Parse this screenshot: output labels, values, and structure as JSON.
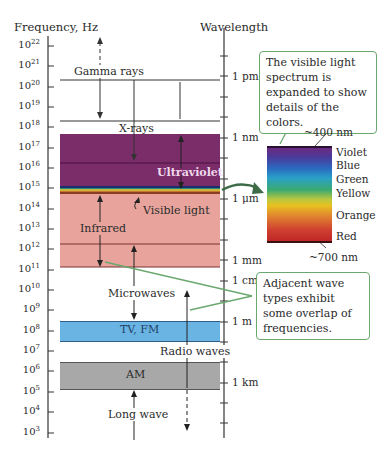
{
  "diagram": {
    "left_axis_title": "Frequency, Hz",
    "right_axis_title": "Wavelength",
    "frequency_ticks": [
      {
        "base": "10",
        "exp": "22"
      },
      {
        "base": "10",
        "exp": "21"
      },
      {
        "base": "10",
        "exp": "20"
      },
      {
        "base": "10",
        "exp": "19"
      },
      {
        "base": "10",
        "exp": "18"
      },
      {
        "base": "10",
        "exp": "17"
      },
      {
        "base": "10",
        "exp": "16"
      },
      {
        "base": "10",
        "exp": "15"
      },
      {
        "base": "10",
        "exp": "14"
      },
      {
        "base": "10",
        "exp": "13"
      },
      {
        "base": "10",
        "exp": "12"
      },
      {
        "base": "10",
        "exp": "11"
      },
      {
        "base": "10",
        "exp": "10"
      },
      {
        "base": "10",
        "exp": "9"
      },
      {
        "base": "10",
        "exp": "8"
      },
      {
        "base": "10",
        "exp": "7"
      },
      {
        "base": "10",
        "exp": "6"
      },
      {
        "base": "10",
        "exp": "5"
      },
      {
        "base": "10",
        "exp": "4"
      },
      {
        "base": "10",
        "exp": "3"
      }
    ],
    "wavelength_labels": {
      "pm": "1 pm",
      "nm": "1 nm",
      "um": "1 μm",
      "mm": "1 mm",
      "cm": "1 cm",
      "m": "1 m",
      "km": "1 km"
    },
    "bands": {
      "gamma": "Gamma rays",
      "xray": "X-rays",
      "uv": "Ultraviolet",
      "visible": "Visible light",
      "ir": "Infrared",
      "microwave": "Microwaves",
      "tvfm": "TV, FM",
      "radio": "Radio waves",
      "am": "AM",
      "longwave": "Long wave"
    },
    "colors": {
      "uv": "#7b2d6a",
      "ir": "#e8a49c",
      "tvfm": "#6ab4e4",
      "am": "#a8a8a8",
      "callout_border": "#6aa86e",
      "arrow": "#3d6b48"
    },
    "callouts": {
      "visible_spectrum": "The visible light spectrum is expanded to show details of the colors.",
      "overlap": "Adjacent wave types exhibit some overlap of frequencies."
    },
    "spectrum": {
      "top_label": "~400 nm",
      "bottom_label": "~700 nm",
      "colors": [
        "Violet",
        "Blue",
        "Green",
        "Yellow",
        "Orange",
        "Red"
      ]
    }
  }
}
